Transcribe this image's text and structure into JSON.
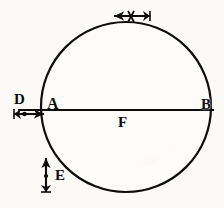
{
  "figure": {
    "kind": "engraving-diagram",
    "background_color": "#fbfaf7",
    "ink_color": "#0d0d0d"
  },
  "labels": {
    "d": "D",
    "a": "A",
    "f": "F",
    "e": "E",
    "b": "B"
  },
  "arrows": {
    "d_arrow": {
      "name": "horizontal-arrow-D",
      "direction": "right",
      "description": "arrow pointing right toward point A"
    },
    "top_arrow": {
      "name": "horizontal-arrow-top",
      "direction": "left",
      "description": "arrow pointing left across the top of the sphere"
    },
    "e_arrow": {
      "name": "vertical-arrow-E",
      "direction": "up",
      "description": "arrow pointing up toward the lower left of the sphere"
    }
  },
  "geometry": {
    "circle": {
      "cx": 126,
      "cy": 107,
      "r": 85
    },
    "diameter_line": {
      "x1": 18,
      "y1": 110,
      "x2": 214,
      "y2": 110
    }
  }
}
